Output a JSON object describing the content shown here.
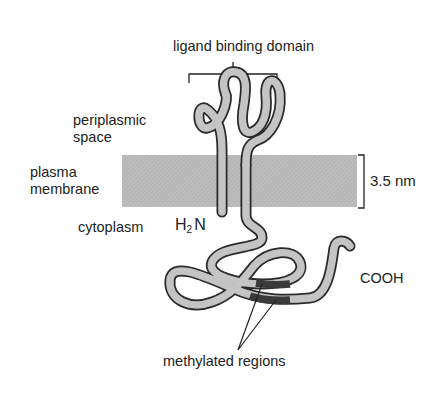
{
  "labels": {
    "ligand_binding_domain": "ligand binding domain",
    "periplasmic_line1": "periplasmic",
    "periplasmic_line2": "space",
    "plasma_line1": "plasma",
    "plasma_line2": "membrane",
    "cytoplasm": "cytoplasm",
    "n_terminus_h": "H",
    "n_terminus_sub": "2",
    "n_terminus_n": "N",
    "c_terminus": "COOH",
    "membrane_thickness": "3.5 nm",
    "methylated_regions": "methylated regions"
  },
  "colors": {
    "membrane_fill": "#b8b8b8",
    "tube_fill": "#c4c4c4",
    "tube_outline": "#2a2a2a",
    "methylated_fill": "#3a3a3a"
  }
}
